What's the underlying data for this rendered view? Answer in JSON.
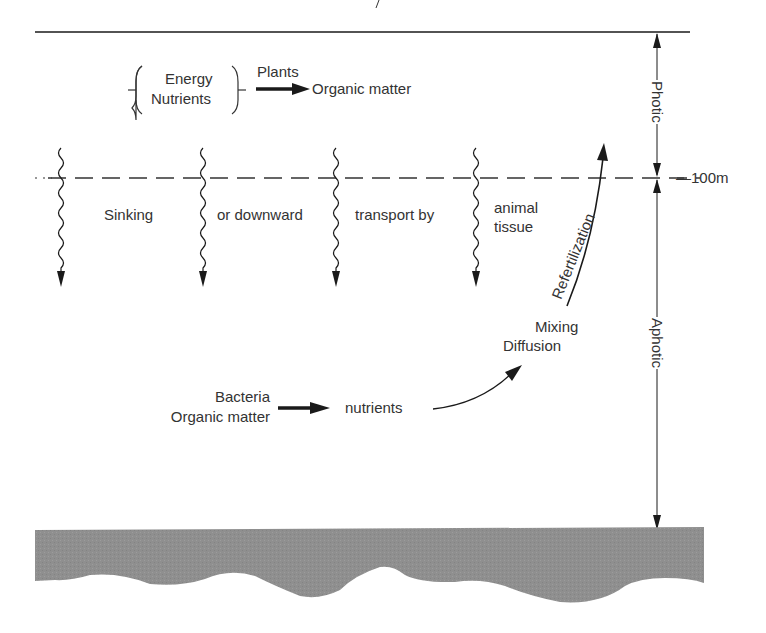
{
  "diagram": {
    "top_mark": "y",
    "zones": {
      "photic": "Photic",
      "aphotic": "Aphotic",
      "boundary_depth": "—100m"
    },
    "surface_process": {
      "inputs": [
        "Energy",
        "Nutrients"
      ],
      "agent": "Plants",
      "output": "Organic matter"
    },
    "sinking_text": {
      "part1": "Sinking",
      "part2": "or downward",
      "part3": "transport by",
      "part4_line1": "animal",
      "part4_line2": "tissue"
    },
    "refertilization": "Refertilization",
    "mixing": {
      "line1": "Mixing",
      "line2": "Diffusion"
    },
    "deep_process": {
      "agent": "Bacteria",
      "input": "Organic matter",
      "output": "nutrients"
    },
    "colors": {
      "ink": "#1a1a1a",
      "seafloor": "#8f8f8f"
    }
  }
}
